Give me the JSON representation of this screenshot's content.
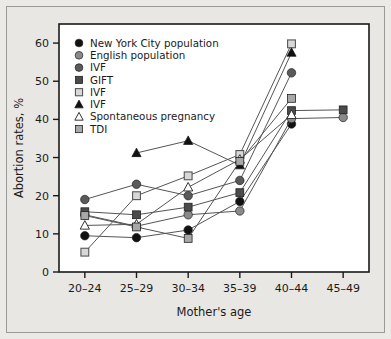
{
  "figure": {
    "background_color": "#e9e7e3",
    "plot_background_color": "#ffffff",
    "frame_color": "#1a1a1a"
  },
  "chart_data": {
    "type": "line",
    "title": "",
    "subtitle": "",
    "xlabel": "Mother's age",
    "ylabel": "Abortion rates, %",
    "categories": [
      "20–24",
      "25–29",
      "30–34",
      "35–39",
      "40–44",
      "45–49"
    ],
    "ylim": [
      0,
      65
    ],
    "yticks": [
      0,
      10,
      20,
      30,
      40,
      50,
      60
    ],
    "ytick_labels": [
      "0",
      "10",
      "20",
      "30",
      "40",
      "50",
      "60"
    ],
    "grid": false,
    "legend_position": "top-left inside",
    "series": [
      {
        "name": "New York City population",
        "marker": "filled-circle",
        "marker_color": "#111111",
        "line_color": "#555555",
        "x": [
          "20–24",
          "25–29",
          "30–34",
          "35–39",
          "40–44"
        ],
        "values": [
          9.5,
          9.0,
          11.0,
          18.5,
          38.8
        ]
      },
      {
        "name": "English population",
        "marker": "filled-circle",
        "marker_color": "#8a8a8a",
        "line_color": "#555555",
        "x": [
          "20–24",
          "25–29",
          "30–34",
          "35–39",
          "40–44",
          "45–49"
        ],
        "values": [
          15.0,
          12.0,
          15.0,
          16.0,
          40.2,
          40.5
        ]
      },
      {
        "name": "IVF",
        "marker": "filled-circle",
        "marker_color": "#5a5a5a",
        "line_color": "#555555",
        "x": [
          "20–24",
          "25–29",
          "30–34",
          "35–39",
          "40–44"
        ],
        "values": [
          19.0,
          23.0,
          20.0,
          24.0,
          52.2
        ]
      },
      {
        "name": "GIFT",
        "marker": "filled-square",
        "marker_color": "#4a4a4a",
        "line_color": "#555555",
        "x": [
          "20–24",
          "25–29",
          "30–34",
          "35–39",
          "40–44",
          "45–49"
        ],
        "values": [
          15.8,
          15.0,
          17.0,
          20.8,
          42.3,
          42.5
        ]
      },
      {
        "name": "IVF",
        "marker": "open-square",
        "marker_color": "#d8d8d8",
        "line_color": "#555555",
        "x": [
          "20–24",
          "25–29",
          "30–34",
          "35–39",
          "40–44"
        ],
        "values": [
          5.2,
          20.0,
          25.2,
          30.8,
          59.8
        ]
      },
      {
        "name": "IVF",
        "marker": "filled-triangle",
        "marker_color": "#111111",
        "line_color": "#555555",
        "x": [
          "25–29",
          "30–34",
          "35–39",
          "40–44"
        ],
        "values": [
          31.2,
          34.4,
          28.0,
          57.5
        ]
      },
      {
        "name": "Spontaneous pregnancy",
        "marker": "open-triangle",
        "marker_color": "#ffffff",
        "line_color": "#555555",
        "x": [
          "20–24",
          "25–29",
          "30–34",
          "35–39",
          "40–44"
        ],
        "values": [
          12.2,
          12.5,
          22.2,
          29.5,
          41.2
        ]
      },
      {
        "name": "TDI",
        "marker": "filled-square-light",
        "marker_color": "#a8a8a8",
        "line_color": "#555555",
        "x": [
          "20–24",
          "25–29",
          "30–34",
          "35–39",
          "40–44"
        ],
        "values": [
          14.8,
          11.8,
          8.8,
          29.0,
          45.5
        ]
      }
    ],
    "legend": [
      {
        "label": "New York City population",
        "marker": "filled-circle",
        "color": "#111111"
      },
      {
        "label": "English population",
        "marker": "filled-circle",
        "color": "#8a8a8a"
      },
      {
        "label": "IVF",
        "marker": "filled-circle",
        "color": "#5a5a5a"
      },
      {
        "label": "GIFT",
        "marker": "filled-square",
        "color": "#4a4a4a"
      },
      {
        "label": "IVF",
        "marker": "open-square",
        "color": "#d8d8d8"
      },
      {
        "label": "IVF",
        "marker": "filled-triangle",
        "color": "#111111"
      },
      {
        "label": "Spontaneous pregnancy",
        "marker": "open-triangle",
        "color": "#ffffff"
      },
      {
        "label": "TDI",
        "marker": "filled-square-light",
        "color": "#a8a8a8"
      }
    ]
  }
}
